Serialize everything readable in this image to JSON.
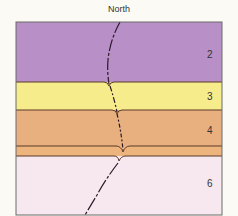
{
  "diagram": {
    "title": "North",
    "layers": [
      {
        "label": "2",
        "color": "#b88fc6",
        "top": 22,
        "bottom": 82
      },
      {
        "label": "3",
        "color": "#f7ec8c",
        "top": 82,
        "bottom": 110
      },
      {
        "label": "4",
        "color": "#e8b07e",
        "top": 110,
        "bottom": 146
      },
      {
        "label": "",
        "color": "#edb47e",
        "top": 146,
        "bottom": 156
      },
      {
        "label": "6",
        "color": "#f6e8ee",
        "top": 156,
        "bottom": 215
      }
    ],
    "boundary_color": "#5a3a2a",
    "fault_color": "#2a1a2a"
  }
}
